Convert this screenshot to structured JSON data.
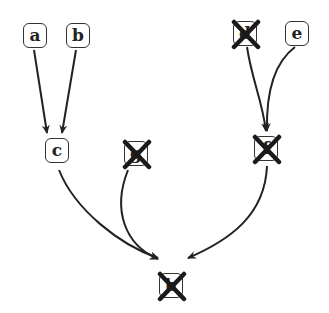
{
  "diagram": {
    "type": "dag",
    "nodes": [
      {
        "id": "a",
        "label": "a",
        "x": 35,
        "y": 35,
        "crossed": false
      },
      {
        "id": "b",
        "label": "b",
        "x": 78,
        "y": 35,
        "crossed": false
      },
      {
        "id": "d",
        "label": "d",
        "x": 245,
        "y": 33,
        "crossed": true
      },
      {
        "id": "e",
        "label": "e",
        "x": 297,
        "y": 33,
        "crossed": false
      },
      {
        "id": "c",
        "label": "c",
        "x": 57,
        "y": 150,
        "crossed": false
      },
      {
        "id": "g",
        "label": "g",
        "x": 136,
        "y": 153,
        "crossed": true
      },
      {
        "id": "f",
        "label": "f",
        "x": 266,
        "y": 148,
        "crossed": true
      },
      {
        "id": "h",
        "label": "h",
        "x": 171,
        "y": 285,
        "crossed": true
      }
    ],
    "edges": [
      {
        "from": "a",
        "to": "c"
      },
      {
        "from": "b",
        "to": "c"
      },
      {
        "from": "d",
        "to": "f"
      },
      {
        "from": "e",
        "to": "f"
      },
      {
        "from": "c",
        "to": "h"
      },
      {
        "from": "g",
        "to": "h"
      },
      {
        "from": "f",
        "to": "h"
      }
    ]
  },
  "colors": {
    "stroke": "#222222",
    "cross": "#1a1a1a",
    "background": "#ffffff"
  }
}
